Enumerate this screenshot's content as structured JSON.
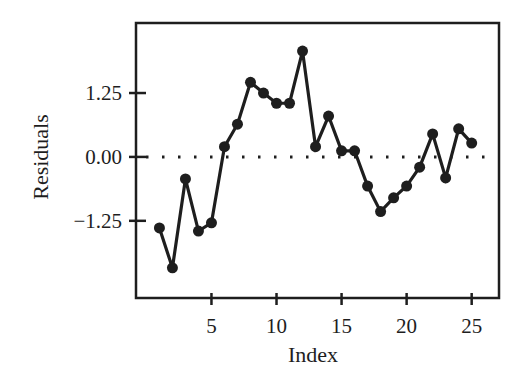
{
  "chart_data": {
    "type": "line",
    "title": "",
    "xlabel": "Index",
    "ylabel": "Residuals",
    "xlim": [
      -0.8,
      27.1
    ],
    "ylim": [
      -2.76,
      2.62
    ],
    "x_ticks": [
      5,
      10,
      15,
      20,
      25
    ],
    "x_tick_labels": [
      "5",
      "10",
      "15",
      "20",
      "25"
    ],
    "y_ticks": [
      1.25,
      0.0,
      -1.25
    ],
    "y_tick_labels": [
      "1.25",
      "0.00",
      "−1.25"
    ],
    "grid": false,
    "legend": null,
    "reference_line": {
      "y": 0.0,
      "style": "dotted"
    },
    "series": [
      {
        "name": "Residuals",
        "marker": "filled-circle",
        "x": [
          1,
          2,
          3,
          4,
          5,
          6,
          7,
          8,
          9,
          10,
          11,
          12,
          13,
          14,
          15,
          16,
          17,
          18,
          19,
          20,
          21,
          22,
          23,
          24,
          25
        ],
        "values": [
          -1.39,
          -2.17,
          -0.43,
          -1.45,
          -1.29,
          0.2,
          0.64,
          1.46,
          1.25,
          1.05,
          1.05,
          2.07,
          0.2,
          0.8,
          0.12,
          0.12,
          -0.57,
          -1.07,
          -0.8,
          -0.57,
          -0.2,
          0.45,
          -0.41,
          0.55,
          0.27
        ]
      }
    ]
  },
  "colors": {
    "ink": "#1e1e1e",
    "background": "#ffffff"
  }
}
